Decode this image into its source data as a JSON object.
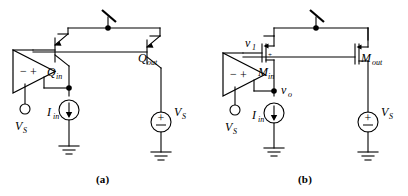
{
  "figure": {
    "type": "circuit-schematic",
    "panels": [
      {
        "caption": "(a)",
        "technology": "bipolar",
        "labels": {
          "transistor_input": "Q",
          "transistor_input_sub": "in",
          "transistor_output": "Q",
          "transistor_output_sub": "out",
          "current_source": "I",
          "current_source_sub": "in",
          "supply_terminal": "V",
          "supply_terminal_sub": "S",
          "supply_source": "V",
          "supply_source_sub": "S",
          "source_plus": "+",
          "source_minus": "−",
          "opamp_minus": "−",
          "opamp_plus": "+"
        }
      },
      {
        "caption": "(b)",
        "technology": "MOS",
        "labels": {
          "transistor_input": "M",
          "transistor_input_sub": "in",
          "transistor_output": "M",
          "transistor_output_sub": "out",
          "current_source": "I",
          "current_source_sub": "in",
          "supply_terminal": "V",
          "supply_terminal_sub": "S",
          "supply_source": "V",
          "supply_source_sub": "S",
          "node_gate": "v",
          "node_gate_sub": "1",
          "node_out": "v",
          "node_out_sub": "o",
          "source_plus": "+",
          "source_minus": "−",
          "opamp_minus": "−",
          "opamp_plus": "+"
        }
      }
    ],
    "colors": {
      "ink": "#000000",
      "background": "#ffffff"
    }
  }
}
